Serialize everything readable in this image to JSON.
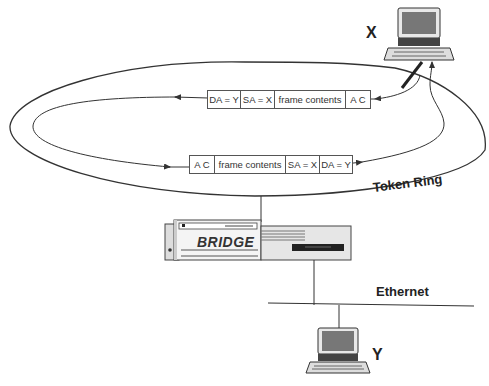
{
  "diagram": {
    "nodes": {
      "x": {
        "label": "X"
      },
      "y": {
        "label": "Y"
      },
      "bridge": {
        "label": "BRIDGE"
      }
    },
    "networks": {
      "token_ring": {
        "label": "Token Ring"
      },
      "ethernet": {
        "label": "Ethernet"
      }
    },
    "frames": {
      "top": {
        "direction": "right-to-left",
        "fields": [
          "DA = Y",
          "SA = X",
          "frame contents",
          "A C"
        ]
      },
      "bottom": {
        "direction": "left-to-right",
        "fields": [
          "A C",
          "frame contents",
          "SA = X",
          "DA = Y"
        ]
      }
    }
  }
}
